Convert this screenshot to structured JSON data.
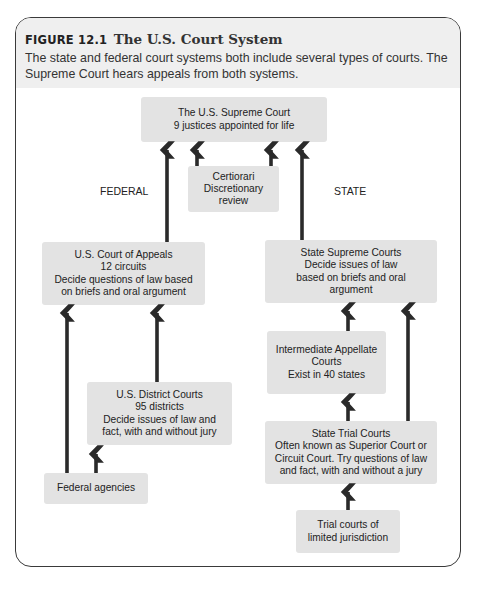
{
  "figure": {
    "number": "FIGURE 12.1",
    "title": "The U.S. Court System",
    "caption": "The state and federal court systems both include several types of courts. The Supreme Court hears appeals from both systems."
  },
  "labels": {
    "federal": "FEDERAL",
    "state": "STATE"
  },
  "nodes": {
    "supreme_court": {
      "lines": [
        "The U.S. Supreme Court",
        "9 justices appointed for life"
      ]
    },
    "certiorari": {
      "lines": [
        "Certiorari",
        "Discretionary",
        "review"
      ]
    },
    "court_of_appeals": {
      "lines": [
        "U.S. Court of Appeals",
        "12 circuits",
        "Decide questions of law based",
        "on briefs and oral argument"
      ]
    },
    "district_courts": {
      "lines": [
        "U.S. District Courts",
        "95 districts",
        "Decide issues of law and",
        "fact, with and without jury"
      ]
    },
    "federal_agencies": {
      "lines": [
        "Federal agencies"
      ]
    },
    "state_supreme": {
      "lines": [
        "State Supreme Courts",
        "Decide issues of law",
        "based on briefs and oral",
        "argument"
      ]
    },
    "intermediate_appellate": {
      "lines": [
        "Intermediate Appellate",
        "Courts",
        "Exist in 40 states"
      ]
    },
    "state_trial": {
      "lines": [
        "State Trial Courts",
        "Often known as Superior Court or",
        "Circuit Court. Try questions of law",
        "and fact, with and without a jury"
      ]
    },
    "limited_jurisdiction": {
      "lines": [
        "Trial courts of",
        "limited jurisdiction"
      ]
    }
  },
  "edges": [
    {
      "from": "court_of_appeals",
      "to": "supreme_court"
    },
    {
      "from": "certiorari",
      "to": "supreme_court"
    },
    {
      "from": "certiorari",
      "to": "supreme_court"
    },
    {
      "from": "state_supreme",
      "to": "supreme_court"
    },
    {
      "from": "federal_agencies",
      "to": "court_of_appeals"
    },
    {
      "from": "district_courts",
      "to": "court_of_appeals"
    },
    {
      "from": "federal_agencies",
      "to": "district_courts"
    },
    {
      "from": "intermediate_appellate",
      "to": "state_supreme"
    },
    {
      "from": "state_trial",
      "to": "state_supreme"
    },
    {
      "from": "state_trial",
      "to": "intermediate_appellate"
    },
    {
      "from": "limited_jurisdiction",
      "to": "state_trial"
    }
  ],
  "colors": {
    "box_fill": "#e3e3e3",
    "header_fill": "#efefef",
    "arrow": "#2a2a2a",
    "border": "#3a3a3a"
  }
}
